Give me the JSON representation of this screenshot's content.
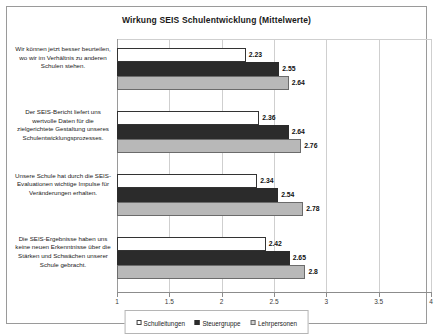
{
  "chart_data": {
    "type": "bar",
    "orientation": "horizontal",
    "title": "Wirkung SEIS Schulentwicklung (Mittelwerte)",
    "xlabel": "",
    "ylabel": "",
    "xlim": [
      1,
      4
    ],
    "xticks": [
      "1",
      "1.5",
      "2",
      "2.5",
      "3",
      "3.5",
      "4"
    ],
    "xtick_values": [
      1,
      1.5,
      2,
      2.5,
      3,
      3.5,
      4
    ],
    "grid": true,
    "legend_position": "bottom",
    "categories": [
      "Wir können jetzt besser beurteilen, wo wir im Verhältnis zu anderen Schulen stehen.",
      "Der SEIS-Bericht liefert uns wertvolle Daten für die zielgerichtete Gestaltung unseres Schulentwicklungsprozesses.",
      "Unsere Schule hat durch die SEIS-Evaluationen wichtige Impulse für Veränderungen erhalten.",
      "Die SEIS-Ergebnisse haben uns keine neuen Erkenntnisse über die Stärken und Schwächen unserer Schule gebracht."
    ],
    "series": [
      {
        "name": "Schulleitungen",
        "color": "#ffffff",
        "values": [
          2.23,
          2.36,
          2.34,
          2.42
        ],
        "labels": [
          "2.23",
          "2.36",
          "2.34",
          "2.42"
        ]
      },
      {
        "name": "Steuergruppe",
        "color": "#2b2b2b",
        "values": [
          2.55,
          2.64,
          2.54,
          2.65
        ],
        "labels": [
          "2.55",
          "2.64",
          "2.54",
          "2.65"
        ]
      },
      {
        "name": "Lehrpersonen",
        "color": "#b8b8b8",
        "values": [
          2.64,
          2.76,
          2.78,
          2.8
        ],
        "labels": [
          "2.64",
          "2.76",
          "2.78",
          "2.8"
        ]
      }
    ]
  }
}
